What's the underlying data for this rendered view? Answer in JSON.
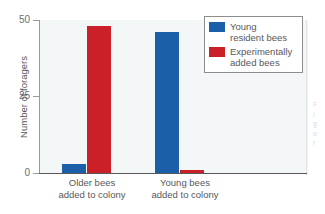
{
  "chart_data": {
    "type": "bar",
    "title": "",
    "subtitle": "",
    "xlabel": "",
    "ylabel": "Number of foragers",
    "ylim": [
      0,
      50
    ],
    "yticks": [
      0,
      25,
      50
    ],
    "ytick_labels": [
      "0",
      "25",
      "50"
    ],
    "grid": false,
    "legend_position": "top-right",
    "categories": [
      "Older bees\nadded to colony",
      "Young bees\nadded to colony"
    ],
    "category_lines": [
      [
        "Older bees",
        "added to colony"
      ],
      [
        "Young bees",
        "added to colony"
      ]
    ],
    "series": [
      {
        "name": "Young resident bees",
        "name_lines": [
          "Young",
          "resident bees"
        ],
        "color": "#1a5fa8",
        "values": [
          3,
          46
        ]
      },
      {
        "name": "Experimentally added bees",
        "name_lines": [
          "Experimentally",
          "added bees"
        ],
        "color": "#cc2028",
        "values": [
          48,
          1
        ]
      }
    ]
  },
  "axis": {
    "y_title": "Number of foragers",
    "tick_50": "50",
    "tick_25": "25",
    "tick_0": "0"
  },
  "categories": {
    "group1_line1": "Older bees",
    "group1_line2": "added to colony",
    "group2_line1": "Young bees",
    "group2_line2": "added to colony"
  },
  "legend": {
    "entry1_line1": "Young",
    "entry1_line2": "resident bees",
    "entry2_line1": "Experimentally",
    "entry2_line2": "added bees"
  },
  "colors": {
    "blue": "#1a5fa8",
    "red": "#cc2028",
    "plot_background": "#f4f7f7",
    "axis": "#58585a",
    "text": "#58585a"
  },
  "margin_artifact": {
    "line1": "F",
    "line2": "i",
    "line3": "g",
    "line4": "u",
    "line5": "r"
  }
}
